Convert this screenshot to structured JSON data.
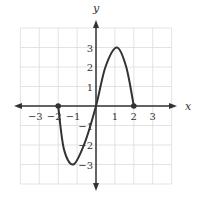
{
  "chart_data": {
    "type": "line",
    "title": "",
    "xlabel": "x",
    "ylabel": "y",
    "xlim": [
      -4,
      4
    ],
    "ylim": [
      -4,
      4
    ],
    "grid": true,
    "x_ticks": [
      -3,
      -2,
      -1,
      1,
      2,
      3
    ],
    "y_ticks": [
      3,
      2,
      1,
      -1,
      -2,
      -3
    ],
    "x_tick_labels": [
      "−3",
      "−2",
      "−1",
      "1",
      "2",
      "3"
    ],
    "y_tick_labels": [
      "3",
      "2",
      "1",
      "−1",
      "−2",
      "−3"
    ],
    "series": [
      {
        "name": "f(x)",
        "x": [
          -2,
          -1.7,
          -1.2,
          -0.6,
          0,
          0.5,
          1.1,
          1.6,
          2
        ],
        "y": [
          0,
          -2.2,
          -3,
          -1.9,
          0,
          2,
          3,
          2,
          0
        ],
        "endpoints": [
          [
            -2,
            0
          ],
          [
            2,
            0
          ]
        ],
        "key_points": {
          "local_min": [
            -1.2,
            -3
          ],
          "local_max": [
            1.1,
            3
          ],
          "origin": [
            0,
            0
          ]
        }
      }
    ],
    "colors": {
      "curve": "#333333",
      "grid": "#dddddd",
      "axes": "#333333"
    }
  }
}
